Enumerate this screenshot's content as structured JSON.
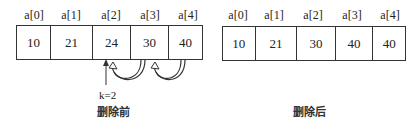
{
  "before": {
    "caption": "删除前",
    "k_label": "k=2",
    "indices": [
      "a[0]",
      "a[1]",
      "a[2]",
      "a[3]",
      "a[4]"
    ],
    "values": [
      "10",
      "21",
      "24",
      "30",
      "40"
    ]
  },
  "after": {
    "caption": "删除后",
    "indices": [
      "a[0]",
      "a[1]",
      "a[2]",
      "a[3]",
      "a[4]"
    ],
    "values": [
      "10",
      "21",
      "30",
      "40",
      "40"
    ]
  }
}
